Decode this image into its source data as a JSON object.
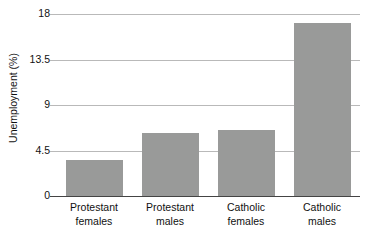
{
  "chart_data": {
    "type": "bar",
    "title": "",
    "subtitle": "",
    "xlabel": "",
    "ylabel": "Unemployment (%)",
    "categories": [
      "Protestant females",
      "Protestant males",
      "Catholic females",
      "Catholic males"
    ],
    "category_lines": [
      [
        "Protestant",
        "females"
      ],
      [
        "Protestant",
        "males"
      ],
      [
        "Catholic",
        "females"
      ],
      [
        "Catholic",
        "males"
      ]
    ],
    "values": [
      3.6,
      6.2,
      6.5,
      17.1
    ],
    "ylim": [
      0,
      18
    ],
    "yticks": [
      0,
      4.5,
      9,
      13.5,
      18
    ],
    "ytick_labels": [
      "0",
      "4.5",
      "9",
      "13.5",
      "18"
    ],
    "grid": true,
    "grid_axis": "y",
    "legend": false,
    "legend_position": "none",
    "bar_color": "#999a99",
    "gridline_color": "#b9b9b9",
    "axis_color": "#444444",
    "background_color": "#ffffff"
  }
}
